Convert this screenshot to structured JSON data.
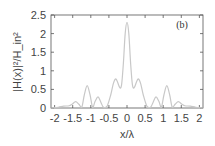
{
  "chart_data": {
    "type": "line",
    "title": "",
    "panel_label": "(b)",
    "xlabel": "x/λ",
    "ylabel": "|H(x)|²/H_in²",
    "xlim": [
      -2.1,
      2.1
    ],
    "ylim": [
      0,
      2.5
    ],
    "x_ticks": [
      "-2",
      "-1.5",
      "-1",
      "-0.5",
      "0",
      "0.5",
      "1",
      "1.5",
      "2"
    ],
    "y_ticks": [
      "0",
      "0.5",
      "1",
      "1.5",
      "2",
      "2.5"
    ],
    "grid": false,
    "legend": null,
    "series": [
      {
        "name": "|H(x)|^2/H_in^2",
        "color": "#c8c8c8",
        "x": [
          -2.1,
          -1.9,
          -1.75,
          -1.6,
          -1.52,
          -1.42,
          -1.33,
          -1.25,
          -1.18,
          -1.1,
          -1.02,
          -0.95,
          -0.88,
          -0.8,
          -0.72,
          -0.65,
          -0.55,
          -0.45,
          -0.38,
          -0.32,
          -0.27,
          -0.2,
          -0.15,
          -0.1,
          -0.05,
          0,
          0.05,
          0.1,
          0.15,
          0.2,
          0.27,
          0.32,
          0.38,
          0.45,
          0.55,
          0.65,
          0.72,
          0.8,
          0.88,
          0.95,
          1.02,
          1.1,
          1.18,
          1.25,
          1.33,
          1.42,
          1.52,
          1.6,
          1.75,
          1.9,
          2.1
        ],
        "y": [
          0.0,
          0.02,
          0.05,
          0.06,
          0.1,
          0.17,
          0.1,
          0.02,
          0.35,
          0.6,
          0.35,
          0.02,
          0.18,
          0.3,
          0.15,
          0.02,
          0.05,
          0.35,
          0.65,
          0.78,
          0.72,
          0.55,
          0.62,
          1.2,
          2.0,
          2.3,
          2.0,
          1.2,
          0.62,
          0.55,
          0.72,
          0.78,
          0.65,
          0.35,
          0.05,
          0.02,
          0.15,
          0.3,
          0.18,
          0.02,
          0.35,
          0.6,
          0.35,
          0.02,
          0.1,
          0.17,
          0.1,
          0.06,
          0.05,
          0.02,
          0.0
        ]
      }
    ]
  }
}
